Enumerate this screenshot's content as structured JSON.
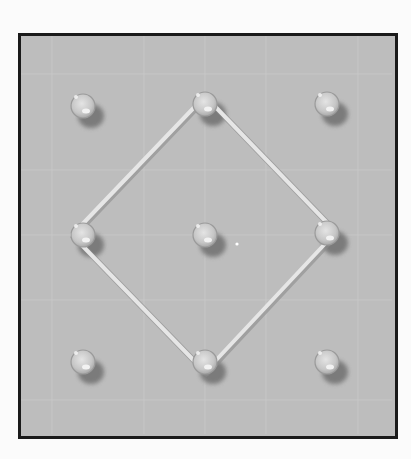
{
  "scene": {
    "description": "Photograph of a 3x3 geoboard with a rubber band stretched into a diamond shape",
    "background_color": "#fbfbfb",
    "board": {
      "x": 18,
      "y": 33,
      "width": 377,
      "height": 404,
      "fill": "#bdbdbd",
      "border_color": "#1a1a1a",
      "border_width": 3,
      "grid_color": "#cacaca",
      "grid_lines_x": [
        52,
        144,
        205,
        266,
        358
      ],
      "grid_lines_y": [
        74,
        170,
        235,
        300,
        400
      ]
    },
    "pegs": [
      {
        "id": "peg-top-left",
        "row": 0,
        "col": 0,
        "cx": 83,
        "cy": 106
      },
      {
        "id": "peg-top-center",
        "row": 0,
        "col": 1,
        "cx": 205,
        "cy": 104
      },
      {
        "id": "peg-top-right",
        "row": 0,
        "col": 2,
        "cx": 327,
        "cy": 104
      },
      {
        "id": "peg-middle-left",
        "row": 1,
        "col": 0,
        "cx": 83,
        "cy": 235
      },
      {
        "id": "peg-center",
        "row": 1,
        "col": 1,
        "cx": 205,
        "cy": 235
      },
      {
        "id": "peg-middle-right",
        "row": 1,
        "col": 2,
        "cx": 327,
        "cy": 233
      },
      {
        "id": "peg-bottom-left",
        "row": 2,
        "col": 0,
        "cx": 83,
        "cy": 362
      },
      {
        "id": "peg-bottom-center",
        "row": 2,
        "col": 1,
        "cx": 205,
        "cy": 362
      },
      {
        "id": "peg-bottom-right",
        "row": 2,
        "col": 2,
        "cx": 327,
        "cy": 362
      }
    ],
    "peg_style": {
      "radius": 12,
      "fill": "#cdcdcd",
      "rim": "#9a9a9a",
      "highlight": "#f2f2f2",
      "shadow": "#6f6f6f",
      "shadow_dx": 8,
      "shadow_dy": 10
    },
    "rubber_band": {
      "shape": "diamond",
      "around_pegs": [
        "peg-top-center",
        "peg-middle-right",
        "peg-bottom-center",
        "peg-middle-left"
      ],
      "points": [
        [
          205,
          96
        ],
        [
          336,
          232
        ],
        [
          205,
          372
        ],
        [
          72,
          235
        ]
      ],
      "color": "#e6e6e6",
      "edge_color": "#8c8c8c",
      "width": 4
    },
    "speck": {
      "cx": 237,
      "cy": 244,
      "r": 1.6,
      "color": "#ffffff"
    }
  }
}
